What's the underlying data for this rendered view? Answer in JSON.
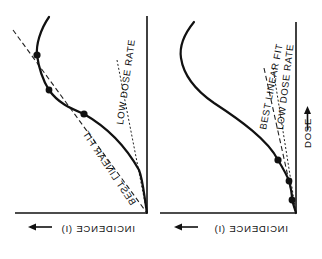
{
  "figure": {
    "panels": [
      {
        "id": "left",
        "labels": {
          "best_linear_fit": "BEST LINEAR FIT",
          "low_dose_rate": "LOW DOSE RATE",
          "x_axis": "INCIDENCE (I)"
        }
      },
      {
        "id": "right",
        "labels": {
          "best_linear_fit": "BEST LINEAR FIT",
          "low_dose_rate": "LOW DOSE RATE",
          "x_axis": "INCIDENCE (I)",
          "y_axis": "DOSE"
        }
      }
    ],
    "colors": {
      "ink": "#111111",
      "background": "#ffffff"
    }
  }
}
